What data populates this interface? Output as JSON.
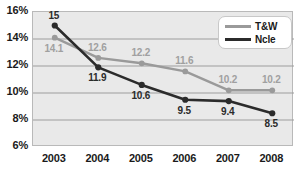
{
  "chart_data": {
    "type": "line",
    "title": "",
    "xlabel": "",
    "ylabel": "",
    "categories": [
      "2003",
      "2004",
      "2005",
      "2006",
      "2007",
      "2008"
    ],
    "series": [
      {
        "name": "T&W",
        "color": "#9a9a9a",
        "values": [
          14.1,
          12.6,
          12.2,
          11.6,
          10.2,
          10.2
        ],
        "labels": [
          "14.1",
          "12.6",
          "12.2",
          "11.6",
          "10.2",
          "10.2"
        ]
      },
      {
        "name": "Ncle",
        "color": "#2b2b2b",
        "values": [
          15.0,
          11.9,
          10.6,
          9.5,
          9.4,
          8.5
        ],
        "labels": [
          "15",
          "11.9",
          "10.6",
          "9.5",
          "9.4",
          "8.5"
        ]
      }
    ],
    "ylim": [
      6,
      16
    ],
    "yticks": [
      6,
      8,
      10,
      12,
      14,
      16
    ],
    "ytick_labels": [
      "6%",
      "8%",
      "10%",
      "12%",
      "14%",
      "16%"
    ],
    "grid": true,
    "legend_position": "top-right",
    "legend_entries": [
      "T&W",
      "Ncle"
    ],
    "plot_background": "#e9e9e9",
    "gridline_color": "#9d9d9d"
  }
}
